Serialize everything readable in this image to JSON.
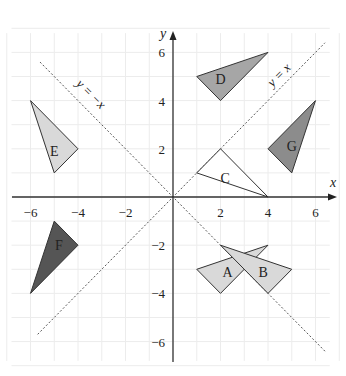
{
  "diagram": {
    "title": "",
    "x_axis_label": "x",
    "y_axis_label": "y",
    "x_ticks": [
      {
        "value": -6,
        "label": "−6"
      },
      {
        "value": -4,
        "label": "−4"
      },
      {
        "value": -2,
        "label": "−2"
      },
      {
        "value": 2,
        "label": "2"
      },
      {
        "value": 4,
        "label": "4"
      },
      {
        "value": 6,
        "label": "6"
      }
    ],
    "y_ticks": [
      {
        "value": 6,
        "label": "6"
      },
      {
        "value": 4,
        "label": "4"
      },
      {
        "value": 2,
        "label": "2"
      },
      {
        "value": -2,
        "label": "−2"
      },
      {
        "value": -4,
        "label": "−4"
      },
      {
        "value": -6,
        "label": "−6"
      }
    ],
    "lines": [
      {
        "name": "y-equals-x",
        "label": "y = x"
      },
      {
        "name": "y-equals-neg-x",
        "label": "y = −x"
      }
    ],
    "shapes": [
      {
        "label": "A",
        "vertices": [
          [
            1,
            -3
          ],
          [
            4,
            -2
          ],
          [
            2,
            -4
          ]
        ],
        "fill": "#d9d9d9"
      },
      {
        "label": "B",
        "vertices": [
          [
            2,
            -2
          ],
          [
            5,
            -3
          ],
          [
            4,
            -4
          ]
        ],
        "fill": "#d9d9d9"
      },
      {
        "label": "C",
        "vertices": [
          [
            1,
            1
          ],
          [
            2,
            2
          ],
          [
            4,
            0
          ]
        ],
        "fill": "#ffffff"
      },
      {
        "label": "D",
        "vertices": [
          [
            1,
            5
          ],
          [
            4,
            6
          ],
          [
            2,
            4
          ]
        ],
        "fill": "#a6a6a6"
      },
      {
        "label": "E",
        "vertices": [
          [
            -6,
            4
          ],
          [
            -4,
            2
          ],
          [
            -5,
            1
          ]
        ],
        "fill": "#d9d9d9"
      },
      {
        "label": "F",
        "vertices": [
          [
            -5,
            -1
          ],
          [
            -4,
            -2
          ],
          [
            -6,
            -4
          ]
        ],
        "fill": "#555555"
      },
      {
        "label": "G",
        "vertices": [
          [
            4,
            2
          ],
          [
            6,
            4
          ],
          [
            5,
            1
          ]
        ],
        "fill": "#8c8c8c"
      }
    ]
  }
}
